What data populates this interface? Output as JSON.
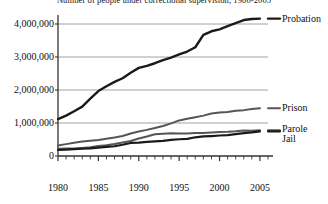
{
  "chart_data": {
    "type": "line",
    "title": "Number of people under correctional supervision, 1980-2005",
    "xlabel": "",
    "ylabel": "",
    "xlim": [
      1980,
      2006
    ],
    "ylim": [
      0,
      4500000
    ],
    "grid": true,
    "legend_position": "right-inline",
    "x": [
      1980,
      1981,
      1982,
      1983,
      1984,
      1985,
      1986,
      1987,
      1988,
      1989,
      1990,
      1991,
      1992,
      1993,
      1994,
      1995,
      1996,
      1997,
      1998,
      1999,
      2000,
      2001,
      2002,
      2003,
      2004,
      2005
    ],
    "yticks": [
      0,
      1000000,
      2000000,
      3000000,
      4000000
    ],
    "ytick_labels": [
      "0",
      "1,000,000",
      "2,000,000",
      "3,000,000",
      "4,000,000"
    ],
    "xticks": [
      1980,
      1985,
      1990,
      1995,
      2000,
      2005
    ],
    "xtick_labels": [
      "1980",
      "1985",
      "1990",
      "1995",
      "2000",
      "2005"
    ],
    "series": [
      {
        "name": "Probation",
        "color": "#1a1a1a",
        "width": 2.4,
        "values": [
          1118000,
          1225000,
          1357000,
          1495000,
          1740000,
          1968000,
          2114000,
          2247000,
          2356000,
          2522000,
          2670000,
          2729000,
          2811000,
          2903000,
          2981000,
          3078000,
          3165000,
          3296000,
          3670000,
          3779000,
          3839000,
          3932000,
          4024000,
          4120000,
          4151000,
          4163000
        ]
      },
      {
        "name": "Prison",
        "color": "#555555",
        "width": 2.0,
        "values": [
          320000,
          360000,
          402000,
          437000,
          464000,
          488000,
          526000,
          562000,
          607000,
          683000,
          743000,
          792000,
          851000,
          909000,
          990000,
          1078000,
          1127000,
          1176000,
          1224000,
          1287000,
          1316000,
          1330000,
          1368000,
          1390000,
          1421000,
          1446000
        ]
      },
      {
        "name": "Parole",
        "color": "#555555",
        "width": 2.0,
        "values": [
          220000,
          225000,
          224000,
          246000,
          266000,
          300000,
          323000,
          362000,
          407000,
          456000,
          531000,
          590000,
          658000,
          676000,
          690000,
          679000,
          680000,
          694000,
          696000,
          714000,
          724000,
          732000,
          750000,
          774000,
          766000,
          784000
        ]
      },
      {
        "name": "Jail",
        "color": "#1a1a1a",
        "width": 2.2,
        "values": [
          182000,
          196000,
          209000,
          223000,
          234000,
          256000,
          274000,
          295000,
          341000,
          395000,
          405000,
          426000,
          444000,
          459000,
          486000,
          507000,
          518000,
          567000,
          592000,
          605000,
          621000,
          631000,
          665000,
          691000,
          714000,
          747000
        ]
      }
    ],
    "series_labels": [
      {
        "name": "Probation",
        "label": "Probation"
      },
      {
        "name": "Prison",
        "label": "Prison"
      },
      {
        "name": "Parole",
        "label": "Parole"
      },
      {
        "name": "Jail",
        "label": "Jail"
      }
    ]
  }
}
